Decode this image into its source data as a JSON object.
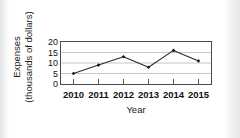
{
  "chart_data": {
    "type": "line",
    "title": "",
    "subtitle": "",
    "xlabel": "Year",
    "ylabel": "Expenses (thousands of dollars)",
    "ylabel_line1": "Expenses",
    "ylabel_line2": "(thousands of dollars)",
    "categories": [
      "2010",
      "2011",
      "2012",
      "2013",
      "2014",
      "2015"
    ],
    "values": [
      5,
      9,
      13,
      8,
      16,
      11
    ],
    "series": [
      {
        "name": "Expenses",
        "values": [
          5,
          9,
          13,
          8,
          16,
          11
        ]
      }
    ],
    "ylim": [
      0,
      20
    ],
    "yticks": [
      0,
      5,
      10,
      15,
      20
    ],
    "ytick_labels": [
      "0",
      "5",
      "10",
      "15",
      "20"
    ],
    "xtick_labels": [
      "2010",
      "2011",
      "2012",
      "2013",
      "2014",
      "2015"
    ],
    "grid": true,
    "grid_axis": "y",
    "legend": false,
    "legend_position": "none",
    "marker": "diamond",
    "line_color": "#2b2b2b",
    "marker_color": "#1a1a1a",
    "grid_color": "#b8b8b8",
    "frame_color": "#4a4a4a",
    "background_color": "#ffffff",
    "text_color": "#111111"
  }
}
